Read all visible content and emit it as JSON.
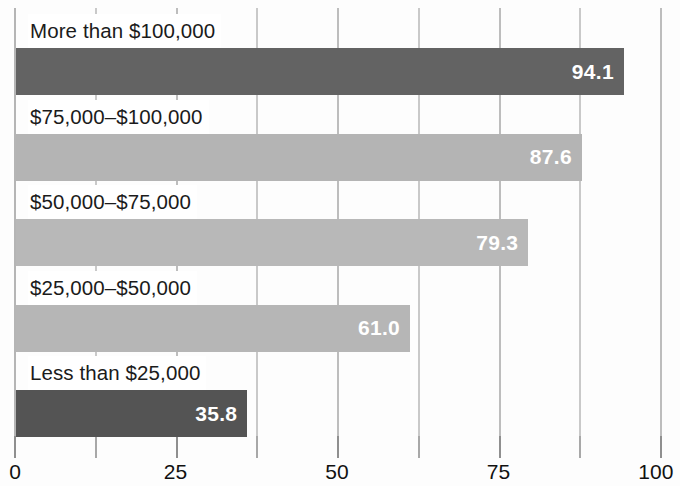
{
  "chart_data": {
    "type": "bar",
    "orientation": "horizontal",
    "title": "",
    "subtitle": "",
    "xlabel": "",
    "ylabel": "",
    "xlim": [
      0,
      100
    ],
    "xticks": [
      0,
      25,
      50,
      75,
      100
    ],
    "xtick_labels": [
      "0",
      "25",
      "50",
      "75",
      "100"
    ],
    "minor_xticks": [
      12.5,
      37.5,
      62.5,
      87.5
    ],
    "grid": true,
    "legend": false,
    "categories": [
      "More than $100,000",
      "$75,000–$100,000",
      "$50,000–$75,000",
      "$25,000–$50,000",
      "Less than $25,000"
    ],
    "values": [
      94.1,
      87.6,
      79.3,
      61.0,
      35.8
    ],
    "value_labels": [
      "94.1",
      "87.6",
      "79.3",
      "61.0",
      "35.8"
    ],
    "bar_colors": [
      "#636363",
      "#b4b4b4",
      "#b8b8b8",
      "#b6b6b6",
      "#545454"
    ],
    "bars": [
      {
        "label": "More than $100,000",
        "value": 94.1,
        "value_label": "94.1",
        "color": "#636363"
      },
      {
        "label": "$75,000–$100,000",
        "value": 87.6,
        "value_label": "87.6",
        "color": "#b4b4b4"
      },
      {
        "label": "$50,000–$75,000",
        "value": 79.3,
        "value_label": "79.3",
        "color": "#b8b8b8"
      },
      {
        "label": "$25,000–$50,000",
        "value": 61.0,
        "value_label": "61.0",
        "color": "#b6b6b6"
      },
      {
        "label": "Less than $25,000",
        "value": 35.8,
        "value_label": "35.8",
        "color": "#545454"
      }
    ],
    "colors": {
      "background": "#ffffff",
      "gridline": "#c9c9c9",
      "axis": "#8f8f8f",
      "label_text": "#1b1b1b",
      "value_text": "#ffffff"
    }
  }
}
